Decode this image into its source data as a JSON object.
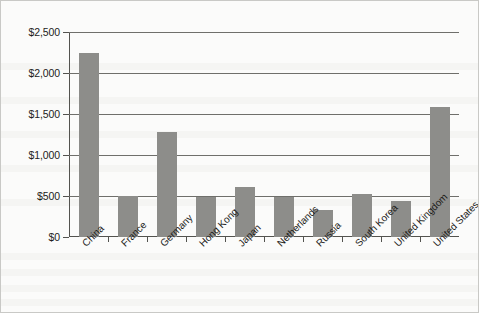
{
  "chart_data": {
    "type": "bar",
    "title": "",
    "subtitle": "",
    "xlabel": "",
    "ylabel": "",
    "categories": [
      "China",
      "France",
      "Germany",
      "Hong Kong",
      "Japan",
      "Netherlands",
      "Russia",
      "South Korea",
      "United Kingdom",
      "United States"
    ],
    "values": [
      2250,
      495,
      1280,
      490,
      605,
      490,
      330,
      530,
      435,
      1590
    ],
    "ylim": [
      0,
      2500
    ],
    "ytick_values": [
      0,
      500,
      1000,
      1500,
      2000,
      2500
    ],
    "ytick_labels": [
      "$0",
      "$500",
      "$1,000",
      "$1,500",
      "$2,000",
      "$2,500"
    ],
    "grid": true,
    "legend": false,
    "legend_position": "none",
    "bar_color": "#8d8d8a",
    "axis_color": "#53534f",
    "gridline_color": "#6f6f6b",
    "background_color": "#fbfbfa",
    "xtick_label_rotation": -45
  }
}
